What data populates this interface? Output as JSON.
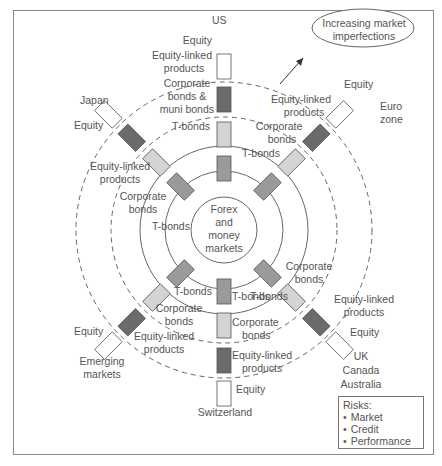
{
  "diagram": {
    "center": {
      "x": 224,
      "y": 230
    },
    "rings": {
      "forex_r": 33,
      "tbonds_r": 59,
      "corporate_r": 84,
      "equity_linked_r": 113,
      "equity_r": 148
    },
    "colors": {
      "equity": "#ffffff",
      "equity_linked": "#6b6b6b",
      "corporate": "#d4d4d4",
      "tbonds": "#9a9a9a",
      "stroke": "#555555"
    },
    "center_label": [
      "Forex",
      "and",
      "money",
      "markets"
    ],
    "annotation": {
      "line1": "Increasing market",
      "line2": "imperfections"
    },
    "regions": {
      "us": "US",
      "japan": "Japan",
      "eurozone": [
        "Euro",
        "zone"
      ],
      "emerging": [
        "Emerging",
        "markets"
      ],
      "switzerland": "Switzerland",
      "uk": [
        "UK",
        "Canada",
        "Australia"
      ]
    },
    "labels": {
      "us_equity": "Equity",
      "us_equity_linked": [
        "Equity-linked",
        "products"
      ],
      "us_corporate": [
        "Corporate",
        "bonds &",
        "muni bonds"
      ],
      "us_tbonds": "T-bonds",
      "jp_equity": "Equity",
      "jp_equity_linked": [
        "Equity-linked",
        "products"
      ],
      "jp_corporate": [
        "Corporate",
        "bonds"
      ],
      "jp_tbonds": "T-bonds",
      "eu_equity": "Equity",
      "eu_equity_linked": [
        "Equity-linked",
        "products"
      ],
      "eu_corporate": [
        "Corporate",
        "bonds"
      ],
      "eu_tbonds": "T-bonds",
      "em_equity": "Equity",
      "em_equity_linked": [
        "Equity-linked",
        "products"
      ],
      "em_corporate": [
        "Corporate",
        "bonds"
      ],
      "em_tbonds": "T-bonds",
      "ch_equity": "Equity",
      "ch_equity_linked": [
        "Equity-linked",
        "products"
      ],
      "ch_corporate": [
        "Corporate",
        "bonds"
      ],
      "ch_tbonds": "T-bonds",
      "uk_equity": "Equity",
      "uk_equity_linked": [
        "Equity-linked",
        "products"
      ],
      "uk_corporate": [
        "Corporate",
        "bonds"
      ],
      "uk_tbonds": "T-bonds"
    },
    "legend": {
      "title": "Risks:",
      "items": [
        "Market",
        "Credit",
        "Performance"
      ]
    }
  }
}
